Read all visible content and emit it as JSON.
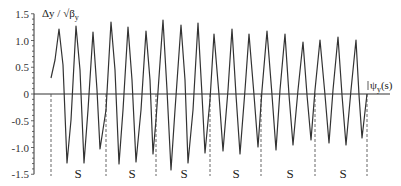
{
  "chart_data": {
    "type": "line",
    "title": "",
    "ylabel": "Δy / √β_y",
    "xlabel": "ψ_y(s)",
    "ylim": [
      -1.5,
      1.5
    ],
    "yticks": [
      1.5,
      1.0,
      0.5,
      0,
      -0.5,
      -1.0,
      -1.5
    ],
    "ytick_labels": [
      "1.5",
      "1.0",
      "0.5",
      "0",
      "-0.5",
      "-1.0",
      "-1.5"
    ],
    "grid": false,
    "legend": null,
    "series": [
      {
        "name": "Δy / √β_y",
        "color": "#333333",
        "points_px": [
          [
            51,
            78
          ],
          [
            55,
            60
          ],
          [
            59,
            29
          ],
          [
            63,
            65
          ],
          [
            67,
            163
          ],
          [
            71,
            120
          ],
          [
            76,
            26
          ],
          [
            80,
            70
          ],
          [
            84,
            163
          ],
          [
            88,
            110
          ],
          [
            93,
            32
          ],
          [
            97,
            90
          ],
          [
            100,
            149
          ],
          [
            106,
            110
          ],
          [
            111,
            22
          ],
          [
            115,
            70
          ],
          [
            119,
            164
          ],
          [
            123,
            110
          ],
          [
            128,
            27
          ],
          [
            132,
            80
          ],
          [
            136,
            162
          ],
          [
            141,
            110
          ],
          [
            146,
            31
          ],
          [
            150,
            80
          ],
          [
            153,
            154
          ],
          [
            156,
            120
          ],
          [
            163,
            20
          ],
          [
            167,
            90
          ],
          [
            171,
            170
          ],
          [
            175,
            110
          ],
          [
            181,
            25
          ],
          [
            185,
            80
          ],
          [
            188,
            163
          ],
          [
            193,
            110
          ],
          [
            198,
            23
          ],
          [
            202,
            95
          ],
          [
            205,
            153
          ],
          [
            210,
            100
          ],
          [
            214,
            34
          ],
          [
            219,
            95
          ],
          [
            223,
            151
          ],
          [
            228,
            90
          ],
          [
            232,
            29
          ],
          [
            236,
            95
          ],
          [
            240,
            154
          ],
          [
            245,
            90
          ],
          [
            249,
            34
          ],
          [
            254,
            95
          ],
          [
            258,
            147
          ],
          [
            262,
            90
          ],
          [
            267,
            31
          ],
          [
            272,
            95
          ],
          [
            276,
            150
          ],
          [
            280,
            90
          ],
          [
            285,
            34
          ],
          [
            289,
            95
          ],
          [
            293,
            145
          ],
          [
            298,
            90
          ],
          [
            303,
            42
          ],
          [
            307,
            95
          ],
          [
            311,
            140
          ],
          [
            315,
            90
          ],
          [
            320,
            40
          ],
          [
            325,
            95
          ],
          [
            329,
            143
          ],
          [
            333,
            90
          ],
          [
            338,
            37
          ],
          [
            342,
            95
          ],
          [
            346,
            145
          ],
          [
            351,
            90
          ],
          [
            356,
            40
          ],
          [
            359,
            95
          ],
          [
            362,
            138
          ],
          [
            367,
            94
          ]
        ]
      }
    ],
    "peaks": [
      1.23,
      1.28,
      1.17,
      1.34,
      1.25,
      1.18,
      1.37,
      1.29,
      1.32,
      1.12,
      1.17,
      1.12,
      1.19,
      1.12,
      0.98,
      1.02,
      1.06,
      1.01
    ],
    "troughs": [
      -1.29,
      -1.29,
      -1.03,
      -1.31,
      -1.27,
      -1.12,
      -1.42,
      -1.29,
      -1.1,
      -1.06,
      -1.1,
      -0.98,
      -1.04,
      -0.95,
      -0.86,
      -0.92,
      -0.95,
      -0.82
    ],
    "dashed_lines_px": [
      51,
      106,
      156,
      210,
      261,
      315,
      367
    ],
    "annotations": [
      {
        "text": "S",
        "x": 78
      },
      {
        "text": "S",
        "x": 132
      },
      {
        "text": "S",
        "x": 184
      },
      {
        "text": "S",
        "x": 236
      },
      {
        "text": "S",
        "x": 290
      },
      {
        "text": "S",
        "x": 343
      }
    ]
  },
  "labels": {
    "ylabel_main": "Δy / √β",
    "ylabel_sub": "y",
    "xlabel_main": "ψ",
    "xlabel_sub": "y",
    "xlabel_tail": "(s)"
  }
}
